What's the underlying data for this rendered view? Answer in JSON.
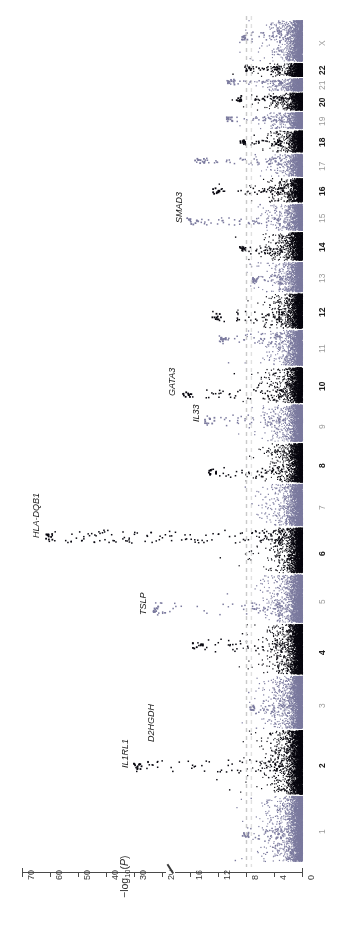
{
  "figure": {
    "orientation": "rotated-90",
    "background": "#ffffff"
  },
  "axis": {
    "label_prefix": "−log",
    "label_sub": "10",
    "label_open": "(",
    "label_italic": "P",
    "label_close": ")",
    "tick_labels": [
      "70",
      "60",
      "50",
      "40",
      "30",
      "20",
      "16",
      "12",
      "8",
      "4",
      "0"
    ],
    "break_between": [
      "30",
      "20"
    ],
    "color": "#4a4a4a"
  },
  "threshold": {
    "value": 8,
    "style": "dashed",
    "color": "#c9c9c9",
    "second_value": 7.3
  },
  "colors": {
    "odd_chromosome": "#7b7a9e",
    "even_chromosome": "#08070f",
    "label_odd": "#9b9b9b",
    "label_even": "#1c1c1c",
    "axis": "#4a4a4a",
    "threshold_line": "#c9c9c9"
  },
  "chromosomes": [
    {
      "name": "1",
      "parity": "odd",
      "width": 80,
      "max": 8.6
    },
    {
      "name": "2",
      "parity": "even",
      "width": 78,
      "max": 30.5
    },
    {
      "name": "3",
      "parity": "odd",
      "width": 64,
      "max": 7.6
    },
    {
      "name": "4",
      "parity": "even",
      "width": 61,
      "max": 15.8
    },
    {
      "name": "5",
      "parity": "odd",
      "width": 58,
      "max": 24.0
    },
    {
      "name": "6",
      "parity": "even",
      "width": 55,
      "max": 62.0
    },
    {
      "name": "7",
      "parity": "odd",
      "width": 51,
      "max": 7.0
    },
    {
      "name": "8",
      "parity": "even",
      "width": 47,
      "max": 13.5
    },
    {
      "name": "9",
      "parity": "odd",
      "width": 45,
      "max": 14.0
    },
    {
      "name": "10",
      "parity": "even",
      "width": 43,
      "max": 17.5
    },
    {
      "name": "11",
      "parity": "odd",
      "width": 43,
      "max": 12.2
    },
    {
      "name": "12",
      "parity": "even",
      "width": 42,
      "max": 13.0
    },
    {
      "name": "13",
      "parity": "odd",
      "width": 36,
      "max": 7.2
    },
    {
      "name": "14",
      "parity": "even",
      "width": 34,
      "max": 9.0
    },
    {
      "name": "15",
      "parity": "odd",
      "width": 32,
      "max": 16.5
    },
    {
      "name": "16",
      "parity": "even",
      "width": 29,
      "max": 13.0
    },
    {
      "name": "17",
      "parity": "odd",
      "width": 27,
      "max": 15.5
    },
    {
      "name": "18",
      "parity": "even",
      "width": 26,
      "max": 9.0
    },
    {
      "name": "19",
      "parity": "odd",
      "width": 20,
      "max": 11.0
    },
    {
      "name": "20",
      "parity": "even",
      "width": 21,
      "max": 9.6
    },
    {
      "name": "21",
      "parity": "odd",
      "width": 15,
      "max": 10.8
    },
    {
      "name": "22",
      "parity": "even",
      "width": 16,
      "max": 8.2
    },
    {
      "name": "X",
      "parity": "odd",
      "width": 50,
      "max": 8.8
    }
  ],
  "gene_annotations": [
    {
      "label": "IL1RL1",
      "chromosome": "2",
      "value": 30.5
    },
    {
      "label": "D2HGDH",
      "chromosome": "2",
      "value": 21.0
    },
    {
      "label": "TSLP",
      "chromosome": "5",
      "value": 24.0
    },
    {
      "label": "HLA-DQB1",
      "chromosome": "6",
      "value": 62.0
    },
    {
      "label": "IL33",
      "chromosome": "9",
      "value": 14.0
    },
    {
      "label": "GATA3",
      "chromosome": "10",
      "value": 17.5
    },
    {
      "label": "SMAD3",
      "chromosome": "15",
      "value": 16.5
    }
  ],
  "chart_data": {
    "type": "scatter",
    "title": "",
    "xlabel": "Chromosome",
    "ylabel": "−log10(P)",
    "ylim": [
      0,
      70
    ],
    "grid": false,
    "legend": "none",
    "significance_threshold": 8,
    "axis_break": [
      20,
      30
    ],
    "tick_values": [
      0,
      4,
      8,
      12,
      16,
      20,
      30,
      40,
      50,
      60,
      70
    ],
    "categories": [
      "1",
      "2",
      "3",
      "4",
      "5",
      "6",
      "7",
      "8",
      "9",
      "10",
      "11",
      "12",
      "13",
      "14",
      "15",
      "16",
      "17",
      "18",
      "19",
      "20",
      "21",
      "22",
      "X"
    ],
    "peak_values": [
      8.6,
      30.5,
      7.6,
      15.8,
      24.0,
      62.0,
      7.0,
      13.5,
      14.0,
      17.5,
      12.2,
      13.0,
      7.2,
      9.0,
      16.5,
      13.0,
      15.5,
      9.0,
      11.0,
      9.6,
      10.8,
      8.2,
      8.8
    ],
    "annotated_loci": [
      {
        "gene": "IL1RL1",
        "chr": "2",
        "neglog10p": 30.5
      },
      {
        "gene": "D2HGDH",
        "chr": "2",
        "neglog10p": 21.0
      },
      {
        "gene": "TSLP",
        "chr": "5",
        "neglog10p": 24.0
      },
      {
        "gene": "HLA-DQB1",
        "chr": "6",
        "neglog10p": 62.0
      },
      {
        "gene": "IL33",
        "chr": "9",
        "neglog10p": 14.0
      },
      {
        "gene": "GATA3",
        "chr": "10",
        "neglog10p": 17.5
      },
      {
        "gene": "SMAD3",
        "chr": "15",
        "neglog10p": 16.5
      }
    ]
  }
}
